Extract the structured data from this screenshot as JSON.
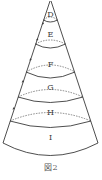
{
  "figure": {
    "caption": "図2",
    "shape": "cone",
    "line_color": "#3a3a3a",
    "dash_color": "#555555",
    "sections": [
      {
        "label": "D",
        "label_y": 17
      },
      {
        "label": "E",
        "label_y": 37
      },
      {
        "label": "F",
        "label_y": 67
      },
      {
        "label": "G",
        "label_y": 90
      },
      {
        "label": "H",
        "label_y": 115
      },
      {
        "label": "I",
        "label_y": 140
      }
    ],
    "markers": [
      "arrow",
      "arrow",
      "arrow",
      "arrow",
      "arrow"
    ]
  }
}
